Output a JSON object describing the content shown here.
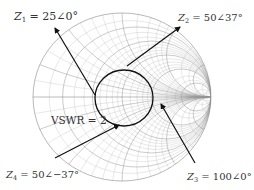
{
  "diagram": {
    "type": "smith-chart",
    "center": {
      "x": 122,
      "y": 97
    },
    "radius_x": 89,
    "radius_y": 84,
    "colors": {
      "grid": "#8a8a8a",
      "arrow": "#111111",
      "label": "#333333",
      "vswr_circle": "#111111"
    },
    "resistance_circles": [
      0,
      0.2,
      0.5,
      1,
      2,
      5
    ],
    "reactance_arcs": [
      0.2,
      0.5,
      1,
      2,
      5
    ],
    "vswr_circle": {
      "label": "VSWR = 2",
      "value": 2
    },
    "impedances": [
      {
        "id": "Z1",
        "label_main": "Z",
        "label_sub": "1",
        "label_value": " = 25∠0°",
        "magnitude": 25,
        "angle_deg": 0
      },
      {
        "id": "Z2",
        "label_main": "Z",
        "label_sub": "2",
        "label_value": " = 50∠37°",
        "magnitude": 50,
        "angle_deg": 37
      },
      {
        "id": "Z3",
        "label_main": "Z",
        "label_sub": "3",
        "label_value": " = 100∠0°",
        "magnitude": 100,
        "angle_deg": 0
      },
      {
        "id": "Z4",
        "label_main": "Z",
        "label_sub": "4",
        "label_value": " = 50∠−37°",
        "magnitude": 50,
        "angle_deg": -37
      }
    ]
  }
}
